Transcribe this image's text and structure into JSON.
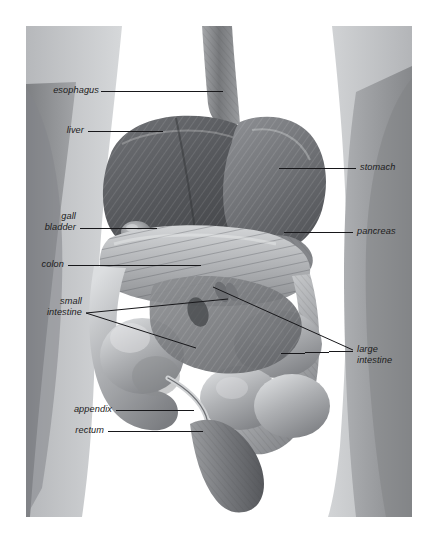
{
  "figure": {
    "panel": {
      "x": 26,
      "y": 26,
      "width": 386,
      "height": 491
    },
    "background_color": "#ffffff",
    "label_color": "#1b1b1b",
    "leader_color": "#17171a"
  },
  "labels": {
    "esophagus": "esophagus",
    "liver": "liver",
    "gall": "gall",
    "bladder": "bladder",
    "colon": "colon",
    "small": "small",
    "intestine": "intestine",
    "appendix": "appendix",
    "rectum": "rectum",
    "stomach": "stomach",
    "pancreas": "pancreas",
    "large": "large",
    "large_intestine": "intestine"
  },
  "anatomy": {
    "left_column": [
      "esophagus",
      "liver",
      "gall bladder",
      "colon",
      "small intestine",
      "appendix",
      "rectum"
    ],
    "right_column": [
      "stomach",
      "pancreas",
      "large intestine"
    ]
  },
  "colors": {
    "silhouette_dark": "#8d8f92",
    "silhouette_mid": "#a7a9ac",
    "silhouette_light": "#c3c5c8",
    "organ_dark": "#4a4b4e",
    "organ_mid": "#74767a",
    "organ_light": "#b9bbbe",
    "highlight": "#e2e3e5"
  }
}
